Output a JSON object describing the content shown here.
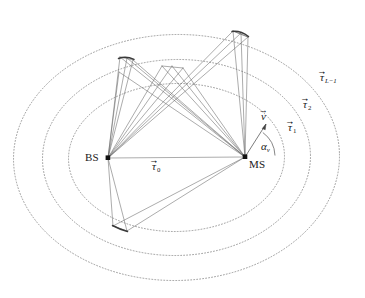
{
  "figure": {
    "name": "multipath-ellipse-geometry",
    "background_color": "#ffffff",
    "line_color": "#555555",
    "ellipse_color": "#7a7a7a",
    "text_color": "#1a1a1a"
  },
  "nodes": {
    "bs": {
      "label": "BS",
      "x": 108,
      "y": 158,
      "label_x": 85,
      "label_y": 152
    },
    "ms": {
      "label": "MS",
      "x": 245,
      "y": 157,
      "label_x": 249,
      "label_y": 159
    }
  },
  "labels": {
    "direct_path": {
      "symbol": "τ",
      "prime": "′",
      "subscript": "0",
      "vector": true,
      "text": "τ′₀",
      "x": 156,
      "y": 160
    },
    "ellipse_1": {
      "symbol": "τ",
      "prime": "′",
      "subscript": "1",
      "vector": true,
      "text": "τ′₁",
      "x": 290,
      "y": 121
    },
    "ellipse_2": {
      "symbol": "τ",
      "prime": "′",
      "subscript": "2",
      "vector": true,
      "text": "τ′₂",
      "x": 305,
      "y": 98
    },
    "ellipse_L": {
      "symbol": "τ",
      "prime": "′",
      "subscript": "L−1",
      "vector": true,
      "text": "τ′_{L−1}",
      "x": 322,
      "y": 71
    },
    "velocity": {
      "symbol": "v",
      "vector": true,
      "text": "v⃗",
      "x": 262,
      "y": 112
    },
    "angle": {
      "symbol": "α",
      "subscript": "v",
      "text": "α_v",
      "x": 262,
      "y": 142
    }
  },
  "ellipses": [
    {
      "name": "tau-1",
      "rx": 108,
      "ry": 74,
      "style": "dotted"
    },
    {
      "name": "tau-2",
      "rx": 134,
      "ry": 98,
      "style": "dotted"
    },
    {
      "name": "tau-L-1",
      "rx": 162,
      "ry": 122,
      "style": "dotted"
    }
  ],
  "scatterer_clusters": [
    {
      "name": "cluster-upper-left",
      "on_ellipse": "tau-L-1"
    },
    {
      "name": "cluster-upper-middle",
      "on_ellipse": "tau-2"
    },
    {
      "name": "cluster-upper-right",
      "on_ellipse": "tau-L-1"
    },
    {
      "name": "cluster-lower-left",
      "on_ellipse": "tau-1"
    }
  ]
}
